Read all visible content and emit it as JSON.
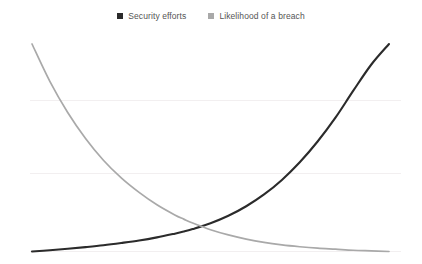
{
  "legend": {
    "position": "top-center",
    "items": [
      {
        "label": "Security efforts",
        "color": "#2b2b2b",
        "marker": "square-marker"
      },
      {
        "label": "Likelihood of a breach",
        "color": "#a9a9a9",
        "marker": "square-marker"
      }
    ]
  },
  "chart_data": {
    "type": "line",
    "title": "",
    "subtitle": "",
    "xlabel": "",
    "ylabel": "",
    "xlim": [
      0,
      100
    ],
    "ylim": [
      0,
      100
    ],
    "grid": true,
    "grid_values": [
      100,
      65.5,
      0
    ],
    "legend_position": "top-center",
    "x": [
      0,
      5,
      10,
      15,
      20,
      25,
      30,
      35,
      40,
      42.5,
      45,
      50,
      55,
      60,
      65,
      70,
      75,
      80,
      85,
      90,
      95,
      100
    ],
    "series": [
      {
        "name": "Security efforts",
        "color": "#2b2b2b",
        "values": [
          0,
          0.6,
          1.3,
          2.1,
          3.0,
          4.1,
          5.3,
          6.8,
          8.6,
          9.6,
          10.8,
          13.6,
          17.2,
          21.8,
          27.5,
          34.5,
          43.0,
          53.0,
          64.5,
          77.5,
          90.0,
          100.0
        ]
      },
      {
        "name": "Likelihood of a breach",
        "color": "#a9a9a9",
        "values": [
          100.0,
          82.0,
          67.0,
          54.5,
          44.0,
          35.5,
          28.5,
          22.5,
          17.6,
          15.6,
          13.7,
          10.5,
          8.0,
          6.0,
          4.4,
          3.2,
          2.3,
          1.6,
          1.1,
          0.6,
          0.3,
          0.0
        ]
      }
    ],
    "annotations": [
      {
        "name": "crossover-point",
        "x": 42.5,
        "y": 9.6
      }
    ]
  }
}
